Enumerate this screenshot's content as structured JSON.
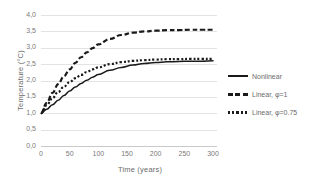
{
  "chart_data": {
    "type": "line",
    "title": "",
    "xlabel": "Time (years)",
    "ylabel": "Temperature (°C)",
    "xlim": [
      0,
      300
    ],
    "ylim": [
      0,
      4
    ],
    "grid": true,
    "legend_position": "right",
    "x_ticks": [
      "0",
      "50",
      "100",
      "150",
      "200",
      "250",
      "300"
    ],
    "y_ticks": [
      "0,0",
      "0,5",
      "1,0",
      "1,5",
      "2,0",
      "2,5",
      "3,0",
      "3,5",
      "4,0"
    ],
    "x": [
      0,
      10,
      20,
      30,
      40,
      50,
      60,
      70,
      80,
      90,
      100,
      120,
      140,
      160,
      180,
      200,
      220,
      240,
      260,
      280,
      300
    ],
    "series": [
      {
        "name": "Nonlinear",
        "style": "solid",
        "color": "#1a1a1a",
        "values": [
          1.0,
          1.12,
          1.26,
          1.4,
          1.54,
          1.68,
          1.8,
          1.91,
          2.01,
          2.1,
          2.18,
          2.31,
          2.4,
          2.47,
          2.52,
          2.55,
          2.57,
          2.58,
          2.59,
          2.59,
          2.6
        ]
      },
      {
        "name": "Linear, φ=1",
        "style": "dashed",
        "color": "#1a1a1a",
        "values": [
          1.0,
          1.32,
          1.62,
          1.89,
          2.13,
          2.34,
          2.54,
          2.71,
          2.86,
          2.99,
          3.1,
          3.27,
          3.39,
          3.46,
          3.5,
          3.52,
          3.54,
          3.54,
          3.55,
          3.55,
          3.55
        ]
      },
      {
        "name": "Linear, φ=0.75",
        "style": "dotted",
        "color": "#1a1a1a",
        "values": [
          1.0,
          1.25,
          1.46,
          1.65,
          1.81,
          1.95,
          2.07,
          2.17,
          2.26,
          2.34,
          2.4,
          2.5,
          2.56,
          2.6,
          2.62,
          2.64,
          2.65,
          2.65,
          2.66,
          2.66,
          2.66
        ]
      }
    ]
  },
  "legend": {
    "entries": [
      {
        "label": "Nonlinear"
      },
      {
        "label": "Linear, φ=1"
      },
      {
        "label": "Linear, φ=0.75"
      }
    ]
  },
  "colors": {
    "line": "#1a1a1a",
    "grid": "#e3e3e3",
    "text": "#6b6b6b"
  }
}
